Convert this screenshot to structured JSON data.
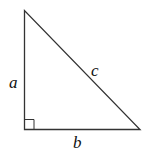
{
  "diagram": {
    "type": "right-triangle",
    "labels": {
      "leg_vertical": "a",
      "leg_horizontal": "b",
      "hypotenuse": "c"
    },
    "right_angle_marker": true,
    "colors": {
      "stroke": "#333333",
      "background": "#ffffff"
    }
  }
}
